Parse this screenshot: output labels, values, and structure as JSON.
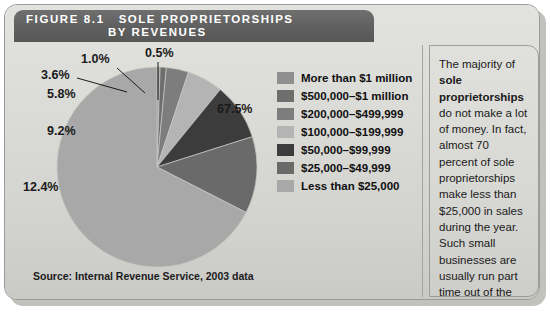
{
  "figure": {
    "number": "FIGURE 8.1",
    "title_line1": "SOLE PROPRIETORSHIPS",
    "title_line2": "BY REVENUES",
    "source": "Source: Internal Revenue Service, 2003 data"
  },
  "sidenote": {
    "text_before": "The majority of ",
    "bold_text": "sole proprietorships",
    "text_after": " do not make a lot of money. In fact, almost 70 percent of sole proprietorships make less than $25,000 in sales during the year. Such small businesses are usually run part time out of the owners' homes."
  },
  "colors": {
    "header_bar": "#5f5f5f",
    "panel_background": "#d9d9d5",
    "slice_more_than_1m": "#8f8f8f",
    "slice_500k_1m": "#6e6e6e",
    "slice_200k_499k": "#7d7d7d",
    "slice_100k_199k": "#b4b4b4",
    "slice_50k_99k": "#3c3c3c",
    "slice_25k_49k": "#6a6a6a",
    "slice_less_than_25k": "#a8a8a8"
  },
  "chart_data": {
    "type": "pie",
    "title": "Sole Proprietorships by Revenues",
    "xlabel": "",
    "ylabel": "",
    "units": "percent",
    "legend_position": "right",
    "grid": false,
    "categories": [
      "More than $1 million",
      "$500,000–$1 million",
      "$200,000–$499,999",
      "$100,000–$199,999",
      "$50,000–$99,999",
      "$25,000–$49,999",
      "Less than $25,000"
    ],
    "values": [
      0.5,
      1.0,
      3.6,
      5.8,
      9.2,
      12.4,
      67.5
    ],
    "value_labels": [
      "0.5%",
      "1.0%",
      "3.6%",
      "5.8%",
      "9.2%",
      "12.4%",
      "67.5%"
    ],
    "colors": [
      "#8f8f8f",
      "#6e6e6e",
      "#7d7d7d",
      "#b4b4b4",
      "#3c3c3c",
      "#6a6a6a",
      "#a8a8a8"
    ],
    "legend": [
      {
        "label": "More than $1 million",
        "color": "#8f8f8f",
        "value": 0.5
      },
      {
        "label": "$500,000–$1 million",
        "color": "#6e6e6e",
        "value": 1.0
      },
      {
        "label": "$200,000–$499,999",
        "color": "#7d7d7d",
        "value": 3.6
      },
      {
        "label": "$100,000–$199,999",
        "color": "#b4b4b4",
        "value": 5.8
      },
      {
        "label": "$50,000–$99,999",
        "color": "#3c3c3c",
        "value": 9.2
      },
      {
        "label": "$25,000–$49,999",
        "color": "#6a6a6a",
        "value": 12.4
      },
      {
        "label": "Less than $25,000",
        "color": "#a8a8a8",
        "value": 67.5
      }
    ],
    "labels_placed": [
      {
        "text": "0.5%",
        "x": 140,
        "y": 4
      },
      {
        "text": "1.0%",
        "x": 76,
        "y": 10
      },
      {
        "text": "3.6%",
        "x": 36,
        "y": 26
      },
      {
        "text": "5.8%",
        "x": 42,
        "y": 45
      },
      {
        "text": "9.2%",
        "x": 42,
        "y": 82
      },
      {
        "text": "12.4%",
        "x": 18,
        "y": 138
      },
      {
        "text": "67.5%",
        "x": 212,
        "y": 60
      }
    ]
  }
}
